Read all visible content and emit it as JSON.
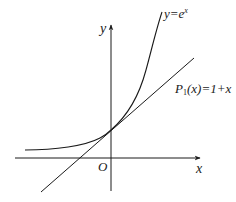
{
  "diagram": {
    "colors": {
      "stroke": "#1a1a1a",
      "background": "#ffffff"
    },
    "axes": {
      "x_label": "x",
      "y_label": "y",
      "origin_label": "O"
    },
    "curves": [
      {
        "id": "exp",
        "label_prefix": "y=e",
        "label_sup": "x",
        "equation": "y = e^x"
      },
      {
        "id": "tangent",
        "label_name": "P",
        "label_sub": "1",
        "label_rest": "(x)=1+x",
        "equation": "P1(x) = 1 + x"
      }
    ],
    "tangent_point": {
      "x": 0,
      "y": 1
    }
  }
}
